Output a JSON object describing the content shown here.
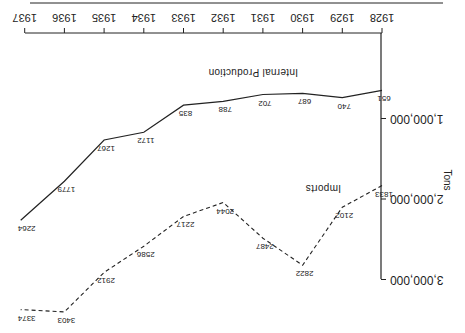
{
  "chart_data": {
    "type": "line",
    "orientation": "rotated 180 degrees",
    "title": "",
    "xlabel": "",
    "ylabel": "Tons",
    "x": [
      "1928",
      "1929",
      "1930",
      "1931",
      "1932",
      "1933",
      "1934",
      "1935",
      "1936",
      "1937"
    ],
    "y_ticks": [
      {
        "value": 1000000,
        "label": "1,000,000"
      },
      {
        "value": 2000000,
        "label": "2,000,000"
      },
      {
        "value": 3000000,
        "label": "3,000,000"
      }
    ],
    "ylim": [
      0,
      3000000
    ],
    "grid": false,
    "series": [
      {
        "name": "Internal Production",
        "style": "solid",
        "point_labels": [
          "651",
          "740",
          "687",
          "702",
          "788",
          "835",
          "1172",
          "1267",
          "1779",
          "2264"
        ],
        "values": [
          651000,
          740000,
          687000,
          702000,
          788000,
          835000,
          1172000,
          1267000,
          1779000,
          2264000
        ]
      },
      {
        "name": "Imports",
        "style": "dashed",
        "point_labels": [
          "1833",
          "2102",
          "2822",
          "2487",
          "2044",
          "2217",
          "2586",
          "2912",
          "3403",
          "3374"
        ],
        "values": [
          1833000,
          2102000,
          2822000,
          2487000,
          2044000,
          2217000,
          2586000,
          2912000,
          3403000,
          3374000
        ]
      }
    ],
    "colors": {
      "line": "#222222",
      "background": "#ffffff"
    }
  }
}
